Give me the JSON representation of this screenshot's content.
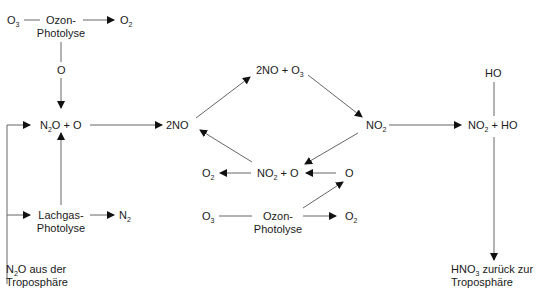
{
  "diagram": {
    "type": "reaction-scheme",
    "topic": "Stratospheric NOx chemistry",
    "nodes": {
      "o3_top": {
        "text": "O",
        "sub": "3"
      },
      "ozon_photolyse_top_1": "Ozon-",
      "ozon_photolyse_top_2": "Photolyse",
      "o2_top": {
        "text": "O",
        "sub": "2"
      },
      "o_top": "O",
      "n2o_o": {
        "pre": "N",
        "sub": "2",
        "post": "O + O"
      },
      "two_no": "2NO",
      "two_no_o3": {
        "pre": "2NO + O",
        "sub": "3"
      },
      "no2_right": {
        "pre": "NO",
        "sub": "2"
      },
      "ho": "HO",
      "no2_ho": {
        "pre": "NO",
        "sub": "2",
        "post": " + HO"
      },
      "no2_o": {
        "pre": "NO",
        "sub": "2",
        "post": " + O"
      },
      "o2_mid": {
        "text": "O",
        "sub": "2"
      },
      "o_mid": "O",
      "o3_bottom": {
        "text": "O",
        "sub": "3"
      },
      "ozon_photolyse_bottom_1": "Ozon-",
      "ozon_photolyse_bottom_2": "Photolyse",
      "o2_bottom": {
        "text": "O",
        "sub": "2"
      },
      "lachgas_photolyse_1": "Lachgas-",
      "lachgas_photolyse_2": "Photolyse",
      "n2": {
        "text": "N",
        "sub": "2"
      },
      "n2o_source_1": {
        "pre": "N",
        "sub": "2",
        "post": "O aus der"
      },
      "n2o_source_2": "Troposphäre",
      "hno3_sink_1": {
        "pre": "HNO",
        "sub": "3",
        "post": " zurück zur"
      },
      "hno3_sink_2": "Troposphäre"
    },
    "edges": [
      [
        "O3",
        "Ozon-Photolyse"
      ],
      [
        "Ozon-Photolyse",
        "O2"
      ],
      [
        "Ozon-Photolyse",
        "O"
      ],
      [
        "O",
        "N2O + O"
      ],
      [
        "N2O aus der Troposphäre",
        "N2O + O"
      ],
      [
        "N2O aus der Troposphäre",
        "Lachgas-Photolyse"
      ],
      [
        "Lachgas-Photolyse",
        "N2"
      ],
      [
        "Lachgas-Photolyse",
        "N2O + O"
      ],
      [
        "N2O + O",
        "2NO"
      ],
      [
        "2NO",
        "2NO + O3"
      ],
      [
        "2NO + O3",
        "NO2"
      ],
      [
        "NO2",
        "NO2 + O"
      ],
      [
        "NO2 + O",
        "2NO"
      ],
      [
        "NO2 + O",
        "O2"
      ],
      [
        "O",
        "NO2 + O"
      ],
      [
        "Ozon-Photolyse (bottom)",
        "O"
      ],
      [
        "O3 (bottom)",
        "Ozon-Photolyse (bottom)"
      ],
      [
        "Ozon-Photolyse (bottom)",
        "O2"
      ],
      [
        "NO2",
        "NO2 + HO"
      ],
      [
        "HO",
        "NO2 + HO"
      ],
      [
        "NO2 + HO",
        "HNO3 zurück zur Troposphäre"
      ]
    ],
    "colors": {
      "line": "#555555",
      "text": "#1a1a1a",
      "background": "#ffffff"
    }
  }
}
